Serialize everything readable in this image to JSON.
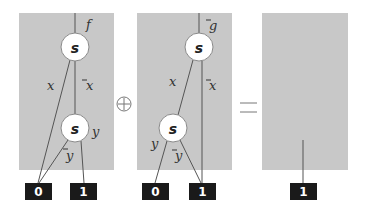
{
  "diagram": {
    "operator_plus": "⊕",
    "operator_equals": "=",
    "panel_left": {
      "root_label": "f",
      "nodes": [
        {
          "label": "s",
          "edge_left": "x",
          "edge_right": "x"
        },
        {
          "label": "s",
          "edge_left": "y",
          "edge_right": "y"
        }
      ],
      "terminals": [
        "0",
        "1"
      ]
    },
    "panel_middle": {
      "root_label": "g",
      "nodes": [
        {
          "label": "s",
          "edge_left": "x",
          "edge_right": "x"
        },
        {
          "label": "s",
          "edge_left": "y",
          "edge_right": "y"
        }
      ],
      "terminals": [
        "0",
        "1"
      ]
    },
    "panel_right": {
      "terminals": [
        "1"
      ]
    }
  }
}
